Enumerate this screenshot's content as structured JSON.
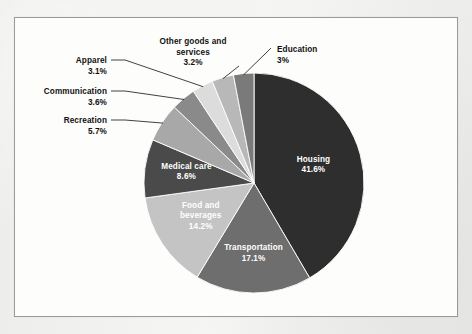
{
  "figure": {
    "background_color": "#fdfdfc",
    "border_color": "#9a9a9a",
    "page_color": "#f1f1ef"
  },
  "chart_data": {
    "type": "pie",
    "title": "",
    "subtitle": "",
    "xlabel": "",
    "ylabel": "",
    "legend_position": "none",
    "grid": false,
    "start_angle_deg": 0,
    "direction": "clockwise",
    "units": "percent",
    "total": 100,
    "categories": [
      "Housing",
      "Transportation",
      "Food and beverages",
      "Medical care",
      "Recreation",
      "Communication",
      "Apparel",
      "Other goods and services",
      "Education"
    ],
    "values": [
      41.6,
      17.1,
      14.2,
      8.6,
      5.7,
      3.6,
      3.1,
      3.2,
      3.0
    ],
    "value_labels": [
      "41.6%",
      "17.1%",
      "14.2%",
      "8.6%",
      "5.7%",
      "3.6%",
      "3.1%",
      "3.2%",
      "3%"
    ],
    "colors": [
      "#2e2e2e",
      "#6e6e6e",
      "#c4c4c4",
      "#4a4a4a",
      "#a8a8a8",
      "#8a8a8a",
      "#dcdcdc",
      "#b8b8b8",
      "#7a7a7a"
    ],
    "slices": [
      {
        "name": "Housing",
        "value": 41.6,
        "value_label": "41.6%",
        "color": "#2e2e2e",
        "label_placement": "inside",
        "label_color": "#ffffff",
        "line1": "Housing",
        "line2": "41.6%"
      },
      {
        "name": "Transportation",
        "value": 17.1,
        "value_label": "17.1%",
        "color": "#6e6e6e",
        "label_placement": "inside",
        "label_color": "#ffffff",
        "line1": "Transportation",
        "line2": "17.1%"
      },
      {
        "name": "Food and beverages",
        "value": 14.2,
        "value_label": "14.2%",
        "color": "#c4c4c4",
        "label_placement": "inside",
        "label_color": "#ffffff",
        "line1": "Food and",
        "line2": "beverages",
        "line3": "14.2%"
      },
      {
        "name": "Medical care",
        "value": 8.6,
        "value_label": "8.6%",
        "color": "#4a4a4a",
        "label_placement": "inside",
        "label_color": "#ffffff",
        "line1": "Medical care",
        "line2": "8.6%"
      },
      {
        "name": "Recreation",
        "value": 5.7,
        "value_label": "5.7%",
        "color": "#a8a8a8",
        "label_placement": "callout",
        "label_color": "#111111",
        "line1": "Recreation",
        "line2": "5.7%"
      },
      {
        "name": "Communication",
        "value": 3.6,
        "value_label": "3.6%",
        "color": "#8a8a8a",
        "label_placement": "callout",
        "label_color": "#111111",
        "line1": "Communication",
        "line2": "3.6%"
      },
      {
        "name": "Apparel",
        "value": 3.1,
        "value_label": "3.1%",
        "color": "#dcdcdc",
        "label_placement": "callout",
        "label_color": "#111111",
        "line1": "Apparel",
        "line2": "3.1%"
      },
      {
        "name": "Other goods and services",
        "value": 3.2,
        "value_label": "3.2%",
        "color": "#b8b8b8",
        "label_placement": "callout",
        "label_color": "#111111",
        "line1": "Other goods and",
        "line2": "services",
        "line3": "3.2%"
      },
      {
        "name": "Education",
        "value": 3.0,
        "value_label": "3%",
        "color": "#7a7a7a",
        "label_placement": "callout",
        "label_color": "#111111",
        "line1": "Education",
        "line2": "3%"
      }
    ]
  }
}
